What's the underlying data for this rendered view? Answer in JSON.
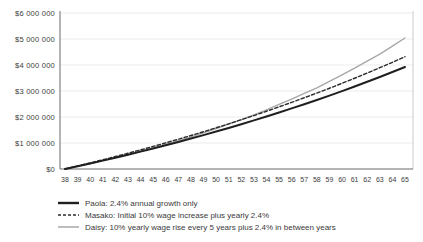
{
  "chart_data": {
    "type": "line",
    "x": [
      38,
      39,
      40,
      41,
      42,
      43,
      44,
      45,
      46,
      47,
      48,
      49,
      50,
      51,
      52,
      53,
      54,
      55,
      56,
      57,
      58,
      59,
      60,
      61,
      62,
      63,
      64,
      65
    ],
    "xlabel": "",
    "ylabel": "",
    "ylim": [
      0,
      6000000
    ],
    "ytick_values": [
      0,
      1000000,
      2000000,
      3000000,
      4000000,
      5000000,
      6000000
    ],
    "ytick_labels": [
      "$0",
      "$1 000 000",
      "$2 000 000",
      "$3 000 000",
      "$4 000 000",
      "$5 000 000",
      "$6 000 000"
    ],
    "grid": true,
    "legend_position": "bottom-left",
    "series": [
      {
        "name": "Paola: 2.4% annual growth only",
        "style": "solid",
        "color": "#1f1f1f",
        "width": 2,
        "values": [
          0,
          105000,
          213000,
          323000,
          435000,
          551000,
          669000,
          790000,
          914000,
          1041000,
          1171000,
          1304000,
          1440000,
          1580000,
          1723000,
          1869000,
          2019000,
          2173000,
          2330000,
          2491000,
          2655000,
          2824000,
          2997000,
          3174000,
          3355000,
          3540000,
          3730000,
          3925000
        ]
      },
      {
        "name": "Masako: Initial 10% wage increase plus yearly 2.4%",
        "style": "dashed",
        "color": "#2b2b2b",
        "width": 1.4,
        "values": [
          0,
          116000,
          234000,
          355000,
          479000,
          606000,
          736000,
          869000,
          1005000,
          1145000,
          1288000,
          1434000,
          1584000,
          1738000,
          1895000,
          2056000,
          2221000,
          2390000,
          2563000,
          2740000,
          2921000,
          3106000,
          3297000,
          3491000,
          3690000,
          3895000,
          4103000,
          4317000
        ]
      },
      {
        "name": "Daisy: 10% yearly wage rise every 5 years plus 2.4% in between years",
        "style": "solid",
        "color": "#a8a8a8",
        "width": 1.4,
        "values": [
          0,
          105000,
          213000,
          323000,
          435000,
          551000,
          681000,
          814000,
          950000,
          1090000,
          1233000,
          1394000,
          1559000,
          1728000,
          1901000,
          2078000,
          2277000,
          2482000,
          2691000,
          2905000,
          3124000,
          3371000,
          3624000,
          3883000,
          4149000,
          4420000,
          4726000,
          5039000
        ]
      }
    ],
    "colors": {
      "axis": "#6b6b6b",
      "gridline": "#ebebeb",
      "right_border": "#cccccc",
      "tick_text": "#3d3d3d"
    }
  }
}
